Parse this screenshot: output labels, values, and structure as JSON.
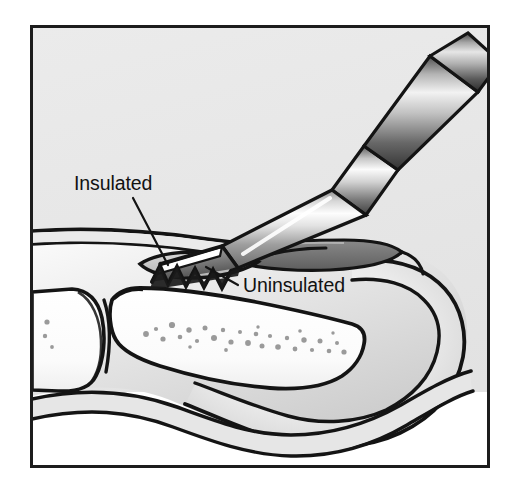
{
  "figure": {
    "type": "medical-line-illustration",
    "style": "black-and-white pen-and-ink with grayscale airbrush shading",
    "frame": {
      "border_color": "#1c1c1c",
      "border_width_px": 3,
      "background_color": "#e8e8e8",
      "lower_background_color": "#ffffff",
      "x": 30,
      "y": 25,
      "width": 460,
      "height": 443
    },
    "palette": {
      "ink": "#141414",
      "background_gray": "#e8e8e8",
      "soft_tissue_gray": "#d9d9d9",
      "soft_tissue_light": "#f0f0f0",
      "bone_fill": "#fbfbfb",
      "bone_stipple": "#9a9a9a",
      "metal_light": "#f7f7f7",
      "metal_mid": "#9c9c9c",
      "metal_dark": "#4a4a4a",
      "nail_gray": "#b8b8b8",
      "white": "#ffffff"
    },
    "labels": [
      {
        "id": "insulated",
        "text": "Insulated",
        "x": 74,
        "y": 190,
        "anchor": "start",
        "leader": {
          "from_x": 133,
          "from_y": 198,
          "to_x": 168,
          "to_y": 265,
          "describes": "insulated shaft segment of the probe"
        }
      },
      {
        "id": "uninsulated",
        "text": "Uninsulated",
        "x": 243,
        "y": 292,
        "anchor": "start",
        "leader": {
          "from_x": 238,
          "from_y": 285,
          "to_x": 206,
          "to_y": 267,
          "describes": "bare serrated active electrode tip"
        }
      }
    ],
    "anatomy": [
      {
        "id": "dorsal-skin",
        "name": "dorsal skin surface",
        "note": "upper skin contour sweeping left to right"
      },
      {
        "id": "nail-plate",
        "name": "nail plate",
        "note": "dark flattened lens over the dorsal fingertip"
      },
      {
        "id": "fingertip-pulp",
        "name": "fingertip pulp",
        "note": "rounded distal soft tissue"
      },
      {
        "id": "distal-phalanx",
        "name": "distal phalanx",
        "note": "large stippled bone occupying the centre"
      },
      {
        "id": "middle-phalanx",
        "name": "middle phalanx",
        "note": "partial bone at far left"
      },
      {
        "id": "dip-joint",
        "name": "distal interphalangeal joint",
        "note": "joint space between the two phalanges"
      },
      {
        "id": "volar-skin",
        "name": "volar skin surface",
        "note": "wavy lower skin contour"
      }
    ],
    "instrument": {
      "name": "insulated electrosurgical probe",
      "parts": [
        {
          "id": "handpiece",
          "name": "conical handpiece",
          "note": "segmented cone at upper right, heavily shaded"
        },
        {
          "id": "shaft",
          "name": "insulated shaft",
          "note": "long cylinder angled down-left"
        },
        {
          "id": "tip",
          "name": "uninsulated serrated tip",
          "note": "wedge with zigzag cutting edge entering joint"
        }
      ]
    }
  }
}
